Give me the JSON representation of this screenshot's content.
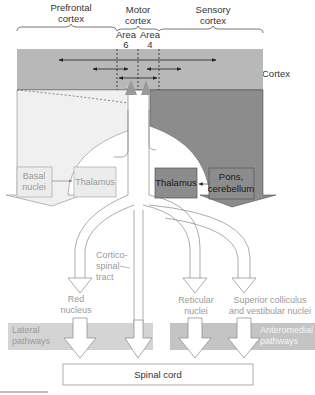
{
  "diagram": {
    "colors": {
      "cortex_band": "#b8b8b8",
      "cortex_lower_dark": "#8c8c8c",
      "cortex_lower_light": "#f0f0f0",
      "basal_nuclei_box": "#ececec",
      "thalamus_left_box": "#ececec",
      "thalamus_right_box": "#8c8c8c",
      "pons_box": "#8c8c8c",
      "pathway_band": "#d4d4d4",
      "spinal_cord_box": "#ffffff"
    },
    "regions": {
      "prefrontal": {
        "line1": "Prefrontal",
        "line2": "cortex"
      },
      "motor": {
        "line1": "Motor",
        "line2": "cortex"
      },
      "sensory": {
        "line1": "Sensory",
        "line2": "cortex"
      },
      "area6": {
        "line1": "Area",
        "line2": "6"
      },
      "area4": {
        "line1": "Area",
        "line2": "4"
      },
      "cortex": "Cortex"
    },
    "boxes": {
      "basal_nuclei": {
        "line1": "Basal",
        "line2": "nuclei"
      },
      "thalamus_left": "Thalamus",
      "thalamus_right": "Thalamus",
      "pons_cerebellum": {
        "line1": "Pons,",
        "line2": "cerebellum"
      },
      "spinal_cord": "Spinal cord"
    },
    "tracts": {
      "corticospinal": {
        "line1": "Cortico-",
        "line2": "spinal",
        "line3": "tract"
      },
      "red_nucleus": {
        "line1": "Red",
        "line2": "nucleus"
      },
      "reticular": {
        "line1": "Reticular",
        "line2": "nuclei"
      },
      "superior": {
        "line1": "Superior colliculus",
        "line2": "and vestibular nuclei"
      }
    },
    "pathways": {
      "lateral": {
        "line1": "Lateral",
        "line2": "pathways"
      },
      "anteromedial": {
        "line1": "Anteromedial",
        "line2": "pathways"
      }
    }
  }
}
